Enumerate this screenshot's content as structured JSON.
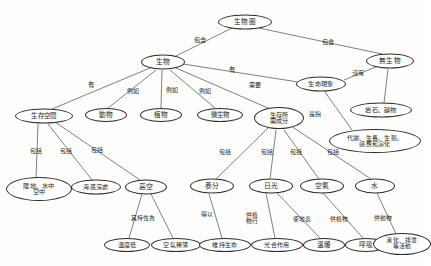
{
  "diagram": {
    "type": "concept-map",
    "language": "zh-Hant",
    "ink_color": "#2b2b2b",
    "background_color": "#fdfdfc",
    "nodes": [
      {
        "id": "n1",
        "label": "生物圈",
        "x": 245,
        "y": 22,
        "w": 54,
        "h": 15,
        "fs": 6.6
      },
      {
        "id": "n2",
        "label": "生物",
        "x": 163,
        "y": 62,
        "w": 44,
        "h": 15,
        "fs": 6.8
      },
      {
        "id": "n3",
        "label": "無生物",
        "x": 390,
        "y": 61,
        "w": 48,
        "h": 15,
        "fs": 6.6
      },
      {
        "id": "n4",
        "label": "生命現象",
        "x": 321,
        "y": 84,
        "w": 50,
        "h": 15,
        "fs": 6.2
      },
      {
        "id": "n5",
        "label": "生存空間",
        "x": 44,
        "y": 116,
        "w": 58,
        "h": 15,
        "fs": 6.4
      },
      {
        "id": "n6",
        "label": "動物",
        "x": 106,
        "y": 115,
        "w": 42,
        "h": 14,
        "fs": 6.6
      },
      {
        "id": "n7",
        "label": "植物",
        "x": 161,
        "y": 115,
        "w": 42,
        "h": 14,
        "fs": 6.6
      },
      {
        "id": "n8",
        "label": "微生物",
        "x": 220,
        "y": 115,
        "w": 46,
        "h": 14,
        "fs": 6.4
      },
      {
        "id": "n9",
        "label": "生存所\n需成分",
        "x": 279,
        "y": 118,
        "w": 50,
        "h": 22,
        "fs": 6.2
      },
      {
        "id": "n10",
        "label": "岩石、礦物",
        "x": 381,
        "y": 110,
        "w": 62,
        "h": 15,
        "fs": 6.2
      },
      {
        "id": "n11",
        "label": "代謝、生長、生殖、\n感應和演化",
        "x": 375,
        "y": 141,
        "w": 92,
        "h": 24,
        "fs": 6.0
      },
      {
        "id": "n12",
        "label": "陸地、水中\n空中",
        "x": 39,
        "y": 189,
        "w": 66,
        "h": 24,
        "fs": 6.2
      },
      {
        "id": "n13",
        "label": "海底深處",
        "x": 96,
        "y": 187,
        "w": 50,
        "h": 15,
        "fs": 6.0
      },
      {
        "id": "n14",
        "label": "高空",
        "x": 146,
        "y": 187,
        "w": 42,
        "h": 15,
        "fs": 6.8
      },
      {
        "id": "n15",
        "label": "養分",
        "x": 212,
        "y": 186,
        "w": 44,
        "h": 15,
        "fs": 6.8
      },
      {
        "id": "n16",
        "label": "日光",
        "x": 271,
        "y": 186,
        "w": 44,
        "h": 15,
        "fs": 6.8
      },
      {
        "id": "n17",
        "label": "空氣",
        "x": 322,
        "y": 186,
        "w": 44,
        "h": 15,
        "fs": 6.8
      },
      {
        "id": "n18",
        "label": "水",
        "x": 375,
        "y": 186,
        "w": 40,
        "h": 15,
        "fs": 6.8
      },
      {
        "id": "n19",
        "label": "溫度低",
        "x": 127,
        "y": 245,
        "w": 46,
        "h": 14,
        "fs": 6.2
      },
      {
        "id": "n20",
        "label": "空氣稀薄",
        "x": 176,
        "y": 245,
        "w": 50,
        "h": 14,
        "fs": 6.0
      },
      {
        "id": "n21",
        "label": "維持生命",
        "x": 225,
        "y": 245,
        "w": 52,
        "h": 14,
        "fs": 6.0
      },
      {
        "id": "n22",
        "label": "光合作用",
        "x": 277,
        "y": 245,
        "w": 52,
        "h": 14,
        "fs": 6.0
      },
      {
        "id": "n23",
        "label": "溫暖",
        "x": 324,
        "y": 245,
        "w": 42,
        "h": 14,
        "fs": 6.6
      },
      {
        "id": "n24",
        "label": "呼吸",
        "x": 366,
        "y": 245,
        "w": 42,
        "h": 14,
        "fs": 6.6
      },
      {
        "id": "n25",
        "label": "消化、排泄\n等活動",
        "x": 402,
        "y": 244,
        "w": 58,
        "h": 22,
        "fs": 5.8
      }
    ],
    "edges": [
      {
        "from": "n1",
        "to": "n2",
        "x1": 232,
        "y1": 28,
        "x2": 176,
        "y2": 56
      },
      {
        "from": "n1",
        "to": "n3",
        "x1": 259,
        "y1": 28,
        "x2": 382,
        "y2": 54
      },
      {
        "from": "n2",
        "to": "n5",
        "x1": 150,
        "y1": 68,
        "x2": 52,
        "y2": 109
      },
      {
        "from": "n2",
        "to": "n6",
        "x1": 156,
        "y1": 70,
        "x2": 108,
        "y2": 108
      },
      {
        "from": "n2",
        "to": "n7",
        "x1": 162,
        "y1": 70,
        "x2": 161,
        "y2": 108
      },
      {
        "from": "n2",
        "to": "n8",
        "x1": 170,
        "y1": 70,
        "x2": 215,
        "y2": 108
      },
      {
        "from": "n2",
        "to": "n9",
        "x1": 176,
        "y1": 68,
        "x2": 268,
        "y2": 108
      },
      {
        "from": "n2",
        "to": "n4",
        "x1": 183,
        "y1": 64,
        "x2": 298,
        "y2": 82
      },
      {
        "from": "n3",
        "to": "n4",
        "x1": 378,
        "y1": 66,
        "x2": 344,
        "y2": 80
      },
      {
        "from": "n3",
        "to": "n10",
        "x1": 388,
        "y1": 69,
        "x2": 384,
        "y2": 103
      },
      {
        "from": "n4",
        "to": "n11",
        "x1": 325,
        "y1": 92,
        "x2": 352,
        "y2": 130
      },
      {
        "from": "n5",
        "to": "n12",
        "x1": 38,
        "y1": 124,
        "x2": 36,
        "y2": 178
      },
      {
        "from": "n5",
        "to": "n13",
        "x1": 48,
        "y1": 124,
        "x2": 92,
        "y2": 180
      },
      {
        "from": "n5",
        "to": "n14",
        "x1": 55,
        "y1": 122,
        "x2": 140,
        "y2": 180
      },
      {
        "from": "n9",
        "to": "n15",
        "x1": 268,
        "y1": 128,
        "x2": 216,
        "y2": 179
      },
      {
        "from": "n9",
        "to": "n16",
        "x1": 276,
        "y1": 130,
        "x2": 270,
        "y2": 179
      },
      {
        "from": "n9",
        "to": "n17",
        "x1": 284,
        "y1": 130,
        "x2": 319,
        "y2": 179
      },
      {
        "from": "n9",
        "to": "n18",
        "x1": 291,
        "y1": 126,
        "x2": 371,
        "y2": 179
      },
      {
        "from": "n14",
        "to": "n19",
        "x1": 142,
        "y1": 194,
        "x2": 129,
        "y2": 238
      },
      {
        "from": "n14",
        "to": "n20",
        "x1": 151,
        "y1": 194,
        "x2": 173,
        "y2": 238
      },
      {
        "from": "n15",
        "to": "n21",
        "x1": 209,
        "y1": 194,
        "x2": 222,
        "y2": 238
      },
      {
        "from": "n16",
        "to": "n22",
        "x1": 266,
        "y1": 193,
        "x2": 275,
        "y2": 238
      },
      {
        "from": "n16",
        "to": "n23",
        "x1": 277,
        "y1": 193,
        "x2": 320,
        "y2": 238
      },
      {
        "from": "n17",
        "to": "n24",
        "x1": 323,
        "y1": 193,
        "x2": 363,
        "y2": 238
      },
      {
        "from": "n18",
        "to": "n25",
        "x1": 377,
        "y1": 193,
        "x2": 396,
        "y2": 234
      }
    ],
    "edge_labels": [
      {
        "id": "e1",
        "text": "包含",
        "x": 200,
        "y": 40,
        "fs": 6.2
      },
      {
        "id": "e2",
        "text": "包含",
        "x": 328,
        "y": 42,
        "fs": 6.2
      },
      {
        "id": "e3",
        "text": "有",
        "x": 91,
        "y": 85,
        "fs": 6.4
      },
      {
        "id": "e4",
        "text": "例如",
        "x": 133,
        "y": 91,
        "fs": 6.0
      },
      {
        "id": "e5",
        "text": "例如",
        "x": 172,
        "y": 90,
        "fs": 6.0
      },
      {
        "id": "e6",
        "text": "例如",
        "x": 205,
        "y": 91,
        "fs": 6.0
      },
      {
        "id": "e7",
        "text": "有",
        "x": 232,
        "y": 70,
        "fs": 6.4
      },
      {
        "id": "e8",
        "text": "需要",
        "x": 255,
        "y": 85,
        "fs": 6.0
      },
      {
        "id": "e9",
        "text": "沒有",
        "x": 358,
        "y": 73,
        "fs": 6.2
      },
      {
        "id": "e10",
        "text": "是指",
        "x": 315,
        "y": 114,
        "fs": 6.0
      },
      {
        "id": "e11",
        "text": "包括",
        "x": 36,
        "y": 151,
        "fs": 6.0
      },
      {
        "id": "e12",
        "text": "包括",
        "x": 66,
        "y": 151,
        "fs": 6.0
      },
      {
        "id": "e13",
        "text": "包括",
        "x": 97,
        "y": 150,
        "fs": 6.0
      },
      {
        "id": "e14",
        "text": "包括",
        "x": 225,
        "y": 152,
        "fs": 6.0
      },
      {
        "id": "e15",
        "text": "包括",
        "x": 267,
        "y": 152,
        "fs": 6.0
      },
      {
        "id": "e16",
        "text": "包括",
        "x": 296,
        "y": 152,
        "fs": 6.0
      },
      {
        "id": "e17",
        "text": "包括",
        "x": 333,
        "y": 152,
        "fs": 6.0
      },
      {
        "id": "e18",
        "text": "其特性為",
        "x": 143,
        "y": 219,
        "fs": 5.8
      },
      {
        "id": "e19",
        "text": "得以",
        "x": 207,
        "y": 215,
        "fs": 5.8
      },
      {
        "id": "e20",
        "text": "供植\n物行",
        "x": 252,
        "y": 219,
        "fs": 5.8
      },
      {
        "id": "e21",
        "text": "使地表",
        "x": 302,
        "y": 220,
        "fs": 5.8
      },
      {
        "id": "e22",
        "text": "供植物",
        "x": 339,
        "y": 220,
        "fs": 5.8
      },
      {
        "id": "e23",
        "text": "供動物",
        "x": 383,
        "y": 219,
        "fs": 5.8
      }
    ]
  }
}
